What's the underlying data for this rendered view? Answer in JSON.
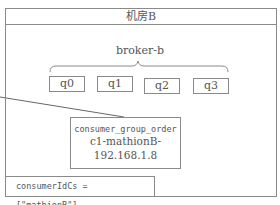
{
  "datacenter": {
    "title": "机房B"
  },
  "broker": {
    "name": "broker-b",
    "queues": [
      {
        "label": "q0"
      },
      {
        "label": "q1"
      },
      {
        "label": "q2"
      },
      {
        "label": "q3"
      }
    ]
  },
  "consumer": {
    "group": "consumer_group_order",
    "client_id_line1": "c1-mathionB-",
    "client_id_line2": "192.168.1.8"
  },
  "consumer_id_cs": {
    "text": "consumerIdCs = [\"mathionB\"]"
  },
  "colors": {
    "border": "#8a8a8a",
    "text": "#555555",
    "background": "#ffffff"
  }
}
